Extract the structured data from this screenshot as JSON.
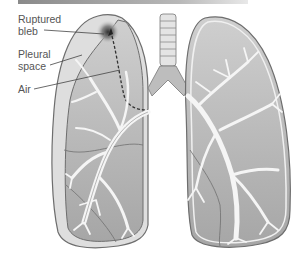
{
  "figure": {
    "labels": [
      {
        "id": "ruptured-bleb",
        "line1": "Ruptured",
        "line2": "bleb"
      },
      {
        "id": "pleural-space",
        "line1": "Pleural",
        "line2": "space"
      },
      {
        "id": "air",
        "line1": "Air"
      }
    ],
    "colors": {
      "lung_fill": "#b5b5b5",
      "pleural_space": "#d9d9d9",
      "outline": "#6e6e6e",
      "bronchi": "#f5f5f5",
      "bleb_dark": "#3a3a3a",
      "trachea": "#e0e0e0"
    }
  }
}
